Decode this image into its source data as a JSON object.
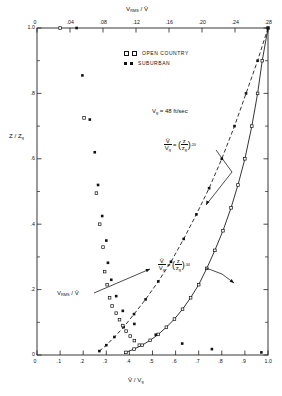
{
  "figure": {
    "top_axis_label": "V_RMS / V̄",
    "bottom_axis_label": "V̄ / V_g",
    "left_axis_label": "Z / Z_g",
    "gradient_velocity_note": "V_g = 48 ft/sec",
    "rms_arrow_label": "V_RMS / V̄"
  },
  "legend": {
    "items": [
      {
        "key": "open-country",
        "label": "OPEN  COUNTRY",
        "marker": "open-square"
      },
      {
        "key": "suburban",
        "label": "SUBURBAN",
        "marker": "filled-square"
      }
    ]
  },
  "annotations": {
    "open_country_eq": {
      "lhs_num": "V̄",
      "lhs_den": "V",
      "lhs_den_sub": "g",
      "rhs_num": "z",
      "rhs_den": "z",
      "rhs_den_sub": "g",
      "exponent": ".20"
    },
    "suburban_eq": {
      "lhs_num": "V̄",
      "lhs_den": "V",
      "lhs_den_sub": "g",
      "rhs_num": "z",
      "rhs_den": "z",
      "rhs_den_sub": "g",
      "exponent": ".34"
    }
  },
  "chart_data": {
    "type": "scatter",
    "title": "",
    "xlabel": "V̄ / V_g",
    "xlabel_top": "V_RMS / V̄",
    "ylabel": "Z / Z_g",
    "xlim": [
      0,
      1.0
    ],
    "xlim_top": [
      0,
      0.28
    ],
    "ylim": [
      0,
      1.0
    ],
    "grid": false,
    "legend_position": "upper-center",
    "x_ticks_bottom": [
      "0",
      ".1",
      ".2",
      ".3",
      ".4",
      ".5",
      ".6",
      ".7",
      ".8",
      ".9",
      "1.0"
    ],
    "x_tick_values_bottom": [
      0,
      0.1,
      0.2,
      0.3,
      0.4,
      0.5,
      0.6,
      0.7,
      0.8,
      0.9,
      1.0
    ],
    "x_ticks_top": [
      "0",
      ".04",
      ".08",
      ".12",
      ".16",
      ".20",
      ".24",
      ".28"
    ],
    "x_tick_values_top": [
      0,
      0.04,
      0.08,
      0.12,
      0.16,
      0.2,
      0.24,
      0.28
    ],
    "y_ticks": [
      "0",
      ".2",
      ".4",
      ".6",
      ".8",
      "1.0"
    ],
    "y_tick_values": [
      0,
      0.2,
      0.4,
      0.6,
      0.8,
      1.0
    ],
    "y_minor_tick_values": [
      0.1,
      0.3,
      0.5,
      0.7,
      0.9
    ],
    "series": [
      {
        "name": "OPEN  COUNTRY",
        "quantity": "mean-velocity",
        "axis": "bottom",
        "marker": "open-square",
        "line": "solid",
        "points": [
          {
            "x": 1.0,
            "y": 1.0
          },
          {
            "x": 0.975,
            "y": 0.9
          },
          {
            "x": 0.955,
            "y": 0.8
          },
          {
            "x": 0.93,
            "y": 0.7
          },
          {
            "x": 0.9,
            "y": 0.6
          },
          {
            "x": 0.87,
            "y": 0.52
          },
          {
            "x": 0.84,
            "y": 0.45
          },
          {
            "x": 0.805,
            "y": 0.38
          },
          {
            "x": 0.77,
            "y": 0.32
          },
          {
            "x": 0.735,
            "y": 0.265
          },
          {
            "x": 0.7,
            "y": 0.215
          },
          {
            "x": 0.665,
            "y": 0.175
          },
          {
            "x": 0.63,
            "y": 0.14
          },
          {
            "x": 0.595,
            "y": 0.11
          },
          {
            "x": 0.56,
            "y": 0.085
          },
          {
            "x": 0.525,
            "y": 0.063
          },
          {
            "x": 0.49,
            "y": 0.045
          },
          {
            "x": 0.455,
            "y": 0.03
          },
          {
            "x": 0.42,
            "y": 0.018
          },
          {
            "x": 0.385,
            "y": 0.008
          }
        ]
      },
      {
        "name": "SUBURBAN",
        "quantity": "mean-velocity",
        "axis": "bottom",
        "marker": "filled-square",
        "line": "dashed",
        "points": [
          {
            "x": 1.0,
            "y": 1.0
          },
          {
            "x": 0.955,
            "y": 0.9
          },
          {
            "x": 0.905,
            "y": 0.8
          },
          {
            "x": 0.855,
            "y": 0.7
          },
          {
            "x": 0.8,
            "y": 0.6
          },
          {
            "x": 0.745,
            "y": 0.51
          },
          {
            "x": 0.69,
            "y": 0.43
          },
          {
            "x": 0.635,
            "y": 0.355
          },
          {
            "x": 0.58,
            "y": 0.285
          },
          {
            "x": 0.525,
            "y": 0.225
          },
          {
            "x": 0.47,
            "y": 0.17
          },
          {
            "x": 0.42,
            "y": 0.125
          },
          {
            "x": 0.375,
            "y": 0.085
          },
          {
            "x": 0.335,
            "y": 0.055
          },
          {
            "x": 0.3,
            "y": 0.03
          },
          {
            "x": 0.27,
            "y": 0.012
          }
        ]
      },
      {
        "name": "OPEN  COUNTRY",
        "quantity": "rms-turbulence",
        "axis": "top",
        "marker": "open-square",
        "line": "none",
        "points": [
          {
            "x": 0.028,
            "y": 1.0
          },
          {
            "x": 0.057,
            "y": 0.725
          },
          {
            "x": 0.072,
            "y": 0.495
          },
          {
            "x": 0.076,
            "y": 0.4
          },
          {
            "x": 0.08,
            "y": 0.33
          },
          {
            "x": 0.082,
            "y": 0.255
          },
          {
            "x": 0.085,
            "y": 0.215
          },
          {
            "x": 0.088,
            "y": 0.175
          },
          {
            "x": 0.091,
            "y": 0.15
          },
          {
            "x": 0.096,
            "y": 0.128
          },
          {
            "x": 0.1,
            "y": 0.108
          },
          {
            "x": 0.104,
            "y": 0.09
          },
          {
            "x": 0.108,
            "y": 0.073
          },
          {
            "x": 0.113,
            "y": 0.058
          },
          {
            "x": 0.118,
            "y": 0.044
          },
          {
            "x": 0.124,
            "y": 0.03
          }
        ]
      },
      {
        "name": "SUBURBAN",
        "quantity": "rms-turbulence",
        "axis": "top",
        "marker": "filled-square",
        "line": "none",
        "points": [
          {
            "x": 0.048,
            "y": 1.0
          },
          {
            "x": 0.055,
            "y": 0.855
          },
          {
            "x": 0.064,
            "y": 0.72
          },
          {
            "x": 0.07,
            "y": 0.62
          },
          {
            "x": 0.074,
            "y": 0.52
          },
          {
            "x": 0.079,
            "y": 0.425
          },
          {
            "x": 0.084,
            "y": 0.35
          },
          {
            "x": 0.086,
            "y": 0.282
          },
          {
            "x": 0.09,
            "y": 0.23
          },
          {
            "x": 0.096,
            "y": 0.18
          },
          {
            "x": 0.104,
            "y": 0.135
          },
          {
            "x": 0.118,
            "y": 0.095
          },
          {
            "x": 0.144,
            "y": 0.062
          },
          {
            "x": 0.176,
            "y": 0.035
          },
          {
            "x": 0.212,
            "y": 0.018
          },
          {
            "x": 0.272,
            "y": 0.008
          }
        ]
      }
    ]
  }
}
